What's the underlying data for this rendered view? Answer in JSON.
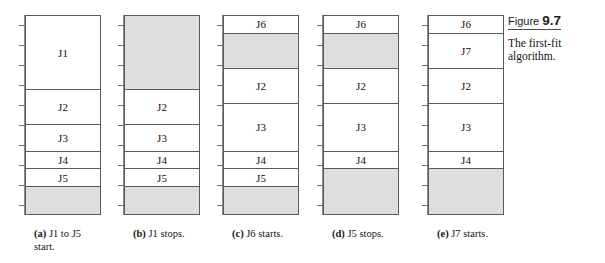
{
  "figure": {
    "label": "Figure",
    "number": "9.7",
    "subtitle": "The first-fit algorithm."
  },
  "diagram": {
    "type": "memory-allocation-timeline",
    "axis_ticks": 10,
    "colors": {
      "free_block": "#dedede",
      "used_block": "#ffffff",
      "border": "#5a5a5a",
      "axis": "#8a8a8a"
    },
    "columns": [
      {
        "tag": "(a)",
        "caption_line1": "J1 to J5",
        "caption_line2": "start.",
        "caption": "J1 to J5 start.",
        "segments": [
          {
            "label": "J1",
            "state": "used",
            "height_pct": 37.5
          },
          {
            "label": "J2",
            "state": "used",
            "height_pct": 17.5
          },
          {
            "label": "J3",
            "state": "used",
            "height_pct": 13.5
          },
          {
            "label": "J4",
            "state": "used",
            "height_pct": 9.0
          },
          {
            "label": "J5",
            "state": "used",
            "height_pct": 9.0
          },
          {
            "label": "",
            "state": "free",
            "height_pct": 13.5
          }
        ]
      },
      {
        "tag": "(b)",
        "caption_line1": "J1 stops.",
        "caption_line2": "",
        "caption": "J1 stops.",
        "segments": [
          {
            "label": "",
            "state": "free",
            "height_pct": 37.5
          },
          {
            "label": "J2",
            "state": "used",
            "height_pct": 17.5
          },
          {
            "label": "J3",
            "state": "used",
            "height_pct": 13.5
          },
          {
            "label": "J4",
            "state": "used",
            "height_pct": 9.0
          },
          {
            "label": "J5",
            "state": "used",
            "height_pct": 9.0
          },
          {
            "label": "",
            "state": "free",
            "height_pct": 13.5
          }
        ]
      },
      {
        "tag": "(c)",
        "caption_line1": "J6 starts.",
        "caption_line2": "",
        "caption": "J6 starts.",
        "segments": [
          {
            "label": "J6",
            "state": "used",
            "height_pct": 9.0
          },
          {
            "label": "",
            "state": "free",
            "height_pct": 18.0
          },
          {
            "label": "J2",
            "state": "used",
            "height_pct": 17.5
          },
          {
            "label": "J3",
            "state": "used",
            "height_pct": 24.0
          },
          {
            "label": "J4",
            "state": "used",
            "height_pct": 9.0
          },
          {
            "label": "J5",
            "state": "used",
            "height_pct": 9.0
          },
          {
            "label": "",
            "state": "free",
            "height_pct": 13.5
          }
        ]
      },
      {
        "tag": "(d)",
        "caption_line1": "J5 stops.",
        "caption_line2": "",
        "caption": "J5 stops.",
        "segments": [
          {
            "label": "J6",
            "state": "used",
            "height_pct": 9.0
          },
          {
            "label": "",
            "state": "free",
            "height_pct": 18.0
          },
          {
            "label": "J2",
            "state": "used",
            "height_pct": 17.5
          },
          {
            "label": "J3",
            "state": "used",
            "height_pct": 24.0
          },
          {
            "label": "J4",
            "state": "used",
            "height_pct": 9.0
          },
          {
            "label": "",
            "state": "free",
            "height_pct": 22.5
          }
        ]
      },
      {
        "tag": "(e)",
        "caption_line1": "J7 starts.",
        "caption_line2": "",
        "caption": "J7 starts.",
        "segments": [
          {
            "label": "J6",
            "state": "used",
            "height_pct": 9.0
          },
          {
            "label": "J7",
            "state": "used",
            "height_pct": 18.0
          },
          {
            "label": "J2",
            "state": "used",
            "height_pct": 17.5
          },
          {
            "label": "J3",
            "state": "used",
            "height_pct": 24.0
          },
          {
            "label": "J4",
            "state": "used",
            "height_pct": 9.0
          },
          {
            "label": "",
            "state": "free",
            "height_pct": 22.5
          }
        ]
      }
    ]
  }
}
